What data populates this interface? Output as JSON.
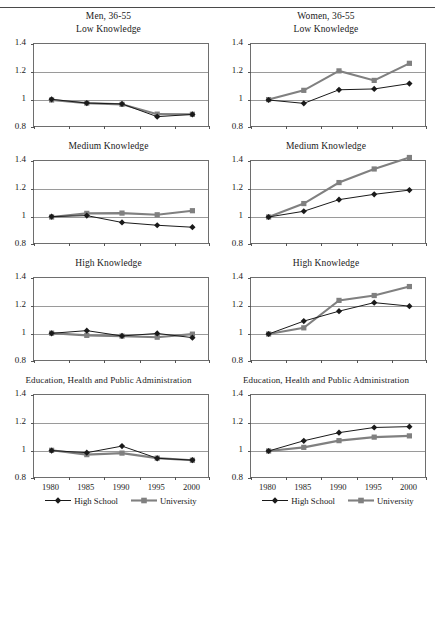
{
  "figure": {
    "columns": [
      {
        "heading": "Men, 36-55"
      },
      {
        "heading": "Women, 36-55"
      }
    ],
    "panel_titles": [
      "Low Knowledge",
      "Medium Knowledge",
      "High Knowledge",
      "Education, Health and Public Administration"
    ],
    "legend": {
      "high_school": "High School",
      "university": "University"
    },
    "colors": {
      "high_school": "#1a1a1a",
      "university": "#808080",
      "grid": "#9a9a9a",
      "axis": "#6e6e6e"
    }
  },
  "chart_data": [
    {
      "type": "line",
      "title": "Low Knowledge",
      "group": "Men, 36-55",
      "x": [
        1980,
        1985,
        1990,
        1995,
        2000
      ],
      "xlabel": "",
      "ylabel": "",
      "ylim": [
        0.8,
        1.4
      ],
      "yticks": [
        0.8,
        1,
        1.2,
        1.4
      ],
      "yticklabels": [
        "0.8",
        "1",
        "1.2",
        "1.4"
      ],
      "grid": true,
      "legend_position": "bottom",
      "series": [
        {
          "name": "High School",
          "values": [
            1.005,
            0.978,
            0.972,
            0.881,
            0.897
          ]
        },
        {
          "name": "University",
          "values": [
            1.0,
            0.978,
            0.969,
            0.899,
            0.898
          ]
        }
      ]
    },
    {
      "type": "line",
      "title": "Low Knowledge",
      "group": "Women, 36-55",
      "x": [
        1980,
        1985,
        1990,
        1995,
        2000
      ],
      "xlabel": "",
      "ylabel": "",
      "ylim": [
        0.8,
        1.4
      ],
      "yticks": [
        0.8,
        1,
        1.2,
        1.4
      ],
      "yticklabels": [
        "0.8",
        "1",
        "1.2",
        "1.4"
      ],
      "grid": true,
      "legend_position": "bottom",
      "series": [
        {
          "name": "High School",
          "values": [
            1.0,
            0.976,
            1.073,
            1.079,
            1.117
          ]
        },
        {
          "name": "University",
          "values": [
            1.003,
            1.069,
            1.208,
            1.14,
            1.262
          ]
        }
      ]
    },
    {
      "type": "line",
      "title": "Medium Knowledge",
      "group": "Men, 36-55",
      "x": [
        1980,
        1985,
        1990,
        1995,
        2000
      ],
      "xlabel": "",
      "ylabel": "",
      "ylim": [
        0.8,
        1.4
      ],
      "yticks": [
        0.8,
        1,
        1.2,
        1.4
      ],
      "yticklabels": [
        "0.8",
        "1",
        "1.2",
        "1.4"
      ],
      "grid": true,
      "legend_position": "bottom",
      "series": [
        {
          "name": "High School",
          "values": [
            1.003,
            1.01,
            0.961,
            0.941,
            0.927
          ]
        },
        {
          "name": "University",
          "values": [
            1.0,
            1.026,
            1.028,
            1.016,
            1.045
          ]
        }
      ]
    },
    {
      "type": "line",
      "title": "Medium Knowledge",
      "group": "Women, 36-55",
      "x": [
        1980,
        1985,
        1990,
        1995,
        2000
      ],
      "xlabel": "",
      "ylabel": "",
      "ylim": [
        0.8,
        1.4
      ],
      "yticks": [
        0.8,
        1,
        1.2,
        1.4
      ],
      "yticklabels": [
        "0.8",
        "1",
        "1.2",
        "1.4"
      ],
      "grid": true,
      "legend_position": "bottom",
      "series": [
        {
          "name": "High School",
          "values": [
            1.0,
            1.041,
            1.124,
            1.162,
            1.192
          ]
        },
        {
          "name": "University",
          "values": [
            1.0,
            1.096,
            1.246,
            1.343,
            1.425
          ]
        }
      ]
    },
    {
      "type": "line",
      "title": "High Knowledge",
      "group": "Men, 36-55",
      "x": [
        1980,
        1985,
        1990,
        1995,
        2000
      ],
      "xlabel": "",
      "ylabel": "",
      "ylim": [
        0.8,
        1.4
      ],
      "yticks": [
        0.8,
        1,
        1.2,
        1.4
      ],
      "yticklabels": [
        "0.8",
        "1",
        "1.2",
        "1.4"
      ],
      "grid": true,
      "legend_position": "bottom",
      "series": [
        {
          "name": "High School",
          "values": [
            1.005,
            1.024,
            0.986,
            1.004,
            0.974
          ]
        },
        {
          "name": "University",
          "values": [
            1.006,
            0.99,
            0.985,
            0.977,
            0.999
          ]
        }
      ]
    },
    {
      "type": "line",
      "title": "High Knowledge",
      "group": "Women, 36-55",
      "x": [
        1980,
        1985,
        1990,
        1995,
        2000
      ],
      "xlabel": "",
      "ylabel": "",
      "ylim": [
        0.8,
        1.4
      ],
      "yticks": [
        0.8,
        1,
        1.2,
        1.4
      ],
      "yticklabels": [
        "0.8",
        "1",
        "1.2",
        "1.4"
      ],
      "grid": true,
      "legend_position": "bottom",
      "series": [
        {
          "name": "High School",
          "values": [
            1.0,
            1.092,
            1.163,
            1.224,
            1.199
          ]
        },
        {
          "name": "University",
          "values": [
            1.0,
            1.044,
            1.24,
            1.275,
            1.339
          ]
        }
      ]
    },
    {
      "type": "line",
      "title": "Education, Health and Public Administration",
      "group": "Men, 36-55",
      "x": [
        1980,
        1985,
        1990,
        1995,
        2000
      ],
      "xlabel": "",
      "ylabel": "",
      "ylim": [
        0.8,
        1.4
      ],
      "yticks": [
        0.8,
        1,
        1.2,
        1.4
      ],
      "yticklabels": [
        "0.8",
        "1",
        "1.2",
        "1.4"
      ],
      "grid": true,
      "legend_position": "bottom",
      "series": [
        {
          "name": "High School",
          "values": [
            1.003,
            0.988,
            1.035,
            0.948,
            0.935
          ]
        },
        {
          "name": "University",
          "values": [
            1.005,
            0.974,
            0.985,
            0.949,
            0.934
          ]
        }
      ]
    },
    {
      "type": "line",
      "title": "Education, Health and Public Administration",
      "group": "Women, 36-55",
      "x": [
        1980,
        1985,
        1990,
        1995,
        2000
      ],
      "xlabel": "",
      "ylabel": "",
      "ylim": [
        0.8,
        1.4
      ],
      "yticks": [
        0.8,
        1,
        1.2,
        1.4
      ],
      "yticklabels": [
        "0.8",
        "1",
        "1.2",
        "1.4"
      ],
      "grid": true,
      "legend_position": "bottom",
      "series": [
        {
          "name": "High School",
          "values": [
            1.0,
            1.073,
            1.131,
            1.168,
            1.174
          ]
        },
        {
          "name": "University",
          "values": [
            1.0,
            1.026,
            1.074,
            1.099,
            1.108
          ]
        }
      ]
    }
  ]
}
